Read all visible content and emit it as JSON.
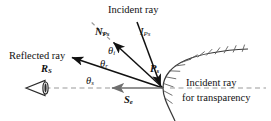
{
  "figure": {
    "title_top": "Incident ray",
    "background": "#ffffff",
    "ink_color": "#111111",
    "dash_color": "#9a9a9a",
    "surface_color": "#555555"
  },
  "labels": {
    "incident_ray": "Incident ray",
    "incident_vector_base": "I",
    "incident_vector_sub": "Ps",
    "normal_vector_base": "N",
    "normal_vector_sub": "Ps",
    "reflected_ray": "Reflected ray",
    "reflected_vector_base": "R",
    "reflected_vector_sub": "S",
    "surface_point_base": "P",
    "surface_point_sub": "s",
    "eye_vector_base": "S",
    "eye_vector_sub": "e",
    "theta_base": "θ",
    "theta_i_sub": "i",
    "theta_r_sub": "r",
    "theta_s_sub": "s",
    "transparency_line1": "Incident ray",
    "transparency_line2": "for transparency"
  },
  "icons": {
    "eye": "eye-icon",
    "surface": "hatched-surface-icon"
  },
  "geometry": {
    "origin_x": 163,
    "origin_y": 88,
    "incident_from": [
      137,
      22
    ],
    "normal_tip": [
      111,
      40
    ],
    "reflected_tip": [
      69,
      56
    ],
    "eye_vector_tip": [
      110,
      88
    ],
    "eye_position": [
      38,
      88
    ]
  }
}
